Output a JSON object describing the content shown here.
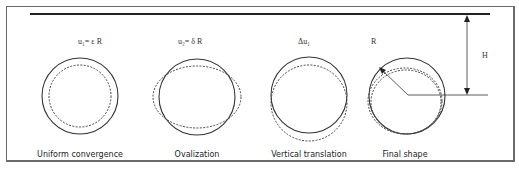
{
  "figure": {
    "panels": [
      {
        "id": "uniform",
        "label": "u₁= ε R",
        "caption": "Uniform convergence"
      },
      {
        "id": "ovalization",
        "label": "u₂= δ R",
        "caption": "Ovalization"
      },
      {
        "id": "translation",
        "label": "Δu₁",
        "caption": "Vertical translation"
      },
      {
        "id": "final",
        "label": "R",
        "caption": "Final shape"
      }
    ],
    "depth_label": "H",
    "legend": {
      "solid_line": "original contour",
      "dashed_line": "deformed contour"
    }
  }
}
